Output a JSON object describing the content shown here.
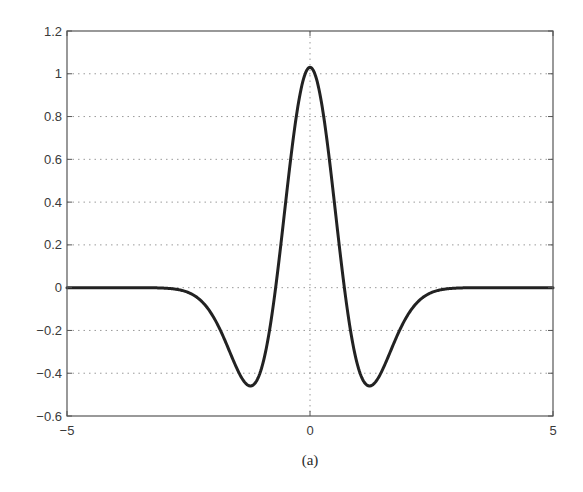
{
  "chart_data": {
    "type": "line",
    "title": "",
    "caption": "(a)",
    "xlabel": "",
    "ylabel": "",
    "xlim": [
      -5,
      5
    ],
    "ylim": [
      -0.6,
      1.2
    ],
    "xticks": [
      -5,
      0,
      5
    ],
    "xtick_labels": [
      "−5",
      "0",
      "5"
    ],
    "yticks": [
      -0.6,
      -0.4,
      -0.2,
      0,
      0.2,
      0.4,
      0.6,
      0.8,
      1,
      1.2
    ],
    "ytick_labels": [
      "−0.6",
      "−0.4",
      "−0.2",
      "0",
      "0.2",
      "0.4",
      "0.6",
      "0.8",
      "1",
      "1.2"
    ],
    "grid": true,
    "grid_style": "dotted",
    "legend": null,
    "series": [
      {
        "name": "wavelet",
        "description": "Mexican-hat (second-derivative-of-Gaussian) wavelet, approx 1.03*(1-2x^2)*exp(-x^2)",
        "color": "#222222",
        "x": [
          -5,
          -4,
          -3,
          -2.5,
          -2,
          -1.75,
          -1.5,
          -1.25,
          -1,
          -0.75,
          -0.5,
          -0.25,
          0,
          0.25,
          0.5,
          0.75,
          1,
          1.25,
          1.5,
          1.75,
          2,
          2.5,
          3,
          4,
          5
        ],
        "y": [
          0,
          0,
          0,
          -0.02,
          -0.13,
          -0.26,
          -0.41,
          -0.46,
          -0.38,
          -0.07,
          0.4,
          0.85,
          1.03,
          0.85,
          0.4,
          -0.07,
          -0.38,
          -0.46,
          -0.41,
          -0.26,
          -0.13,
          -0.02,
          0,
          0,
          0
        ]
      }
    ],
    "key_points": {
      "peak": {
        "x": 0,
        "y": 1.03
      },
      "minima": [
        {
          "x": -1.22,
          "y": -0.46
        },
        {
          "x": 1.22,
          "y": -0.46
        }
      ],
      "zero_crossings": [
        -0.71,
        0.71
      ]
    }
  },
  "colors": {
    "line": "#222222",
    "axes": "#555555",
    "grid": "#9a9a9a",
    "text": "#3a3a3a"
  }
}
